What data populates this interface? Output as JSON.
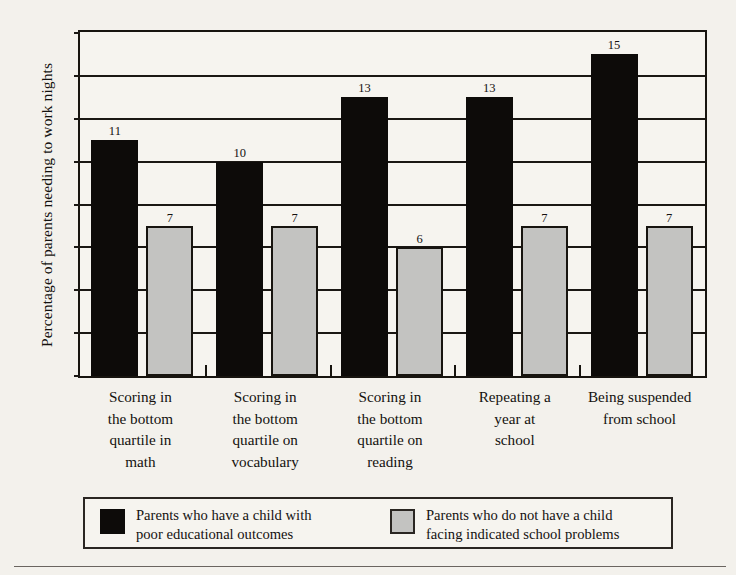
{
  "chart_data": {
    "type": "bar",
    "title": "",
    "xlabel": "",
    "ylabel": "Percentage of parents needing to work nights",
    "ylim": [
      0,
      16
    ],
    "ytick_step": 2,
    "yticks": [
      0,
      2,
      4,
      6,
      8,
      10,
      12,
      14,
      16
    ],
    "grid": true,
    "legend_position": "bottom",
    "categories": [
      "Scoring in\nthe bottom\nquartile in\nmath",
      "Scoring in\nthe bottom\nquartile on\nvocabulary",
      "Scoring in\nthe bottom\nquartile on\nreading",
      "Repeating a\nyear at\nschool",
      "Being suspended\nfrom school"
    ],
    "series": [
      {
        "name": "Parents who have a child with\npoor educational outcomes",
        "color": "#0d0b09",
        "values": [
          11,
          10,
          13,
          13,
          15
        ]
      },
      {
        "name": "Parents who do not have a child\nfacing indicated school problems",
        "color": "#c3c3c1",
        "values": [
          7,
          7,
          6,
          7,
          7
        ]
      }
    ]
  },
  "legend": {
    "entries": [
      {
        "label": "Parents who have a child with\npoor educational outcomes",
        "swatch": "dark-swatch"
      },
      {
        "label": "Parents who do not have a child\nfacing indicated school problems",
        "swatch": "light-swatch"
      }
    ]
  }
}
